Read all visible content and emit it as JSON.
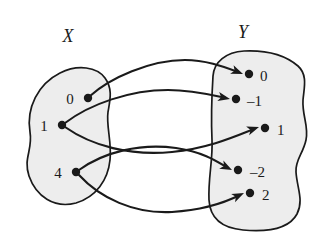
{
  "figure": {
    "title": "",
    "type": "set-mapping-diagram",
    "background_color": "#ffffff",
    "ink_color": "#1a1a1a",
    "blob_fill_color": "#ededed"
  },
  "sets": {
    "domain": {
      "name": "X",
      "label_x": 68,
      "label_y": 42,
      "blob_path": "M 30 132 C 26 108, 38 84, 60 73 C 78 64, 97 67, 105 78 C 113 89, 110 100, 108 112 C 106 126, 112 142, 110 160 C 108 180, 96 197, 76 203 C 54 209, 36 196, 29 176 C 23 158, 33 150, 30 132 Z",
      "elements": [
        {
          "label": "0",
          "dot_x": 88,
          "dot_y": 98,
          "text_x": 70,
          "text_y": 104
        },
        {
          "label": "1",
          "dot_x": 62,
          "dot_y": 125,
          "text_x": 44,
          "text_y": 131
        },
        {
          "label": "4",
          "dot_x": 76,
          "dot_y": 172,
          "text_x": 58,
          "text_y": 178
        }
      ]
    },
    "codomain": {
      "name": "Y",
      "label_x": 243,
      "label_y": 38,
      "blob_path": "M 213 76 C 214 62, 226 52, 244 51 C 266 50, 284 54, 298 66 C 308 75, 304 88, 303 100 C 302 116, 309 126, 306 140 C 303 154, 295 160, 296 172 C 297 188, 304 200, 297 214 C 289 229, 266 232, 243 230 C 222 228, 210 218, 209 200 C 208 178, 213 160, 212 140 C 211 118, 212 92, 213 76 Z",
      "elements": [
        {
          "label": "0",
          "dot_x": 249,
          "dot_y": 74,
          "text_x": 260,
          "text_y": 81
        },
        {
          "label": "–1",
          "dot_x": 236,
          "dot_y": 99,
          "text_x": 247,
          "text_y": 106
        },
        {
          "label": "1",
          "dot_x": 265,
          "dot_y": 128,
          "text_x": 277,
          "text_y": 135
        },
        {
          "label": "–2",
          "dot_x": 238,
          "dot_y": 170,
          "text_x": 250,
          "text_y": 177
        },
        {
          "label": "2",
          "dot_x": 250,
          "dot_y": 193,
          "text_x": 262,
          "text_y": 200
        }
      ]
    }
  },
  "mappings": [
    {
      "name": "zero-to-zero",
      "from": "0",
      "to": "0",
      "path": "M 90 96 C 110 78, 150 60, 185 60 C 205 60, 222 66, 238 72",
      "head_x": 243,
      "head_y": 74,
      "head_angle": 22
    },
    {
      "name": "one-to-negative-one",
      "from": "1",
      "to": "–1",
      "path": "M 65 123 C 90 104, 130 90, 168 90 C 192 90, 212 95, 226 98",
      "head_x": 230,
      "head_y": 99,
      "head_angle": 12
    },
    {
      "name": "one-to-one",
      "from": "1",
      "to": "1",
      "path": "M 65 127 C 92 146, 130 156, 172 152 C 210 148, 236 136, 254 129",
      "head_x": 259,
      "head_y": 127,
      "head_angle": -19
    },
    {
      "name": "four-to-negative-two",
      "from": "4",
      "to": "–2",
      "path": "M 79 170 C 104 152, 140 143, 176 148 C 204 152, 218 162, 228 168",
      "head_x": 232,
      "head_y": 170,
      "head_angle": 27
    },
    {
      "name": "four-to-two",
      "from": "4",
      "to": "2",
      "path": "M 79 175 C 100 198, 134 214, 172 212 C 204 210, 228 201, 240 195",
      "head_x": 244,
      "head_y": 193,
      "head_angle": -25
    }
  ]
}
